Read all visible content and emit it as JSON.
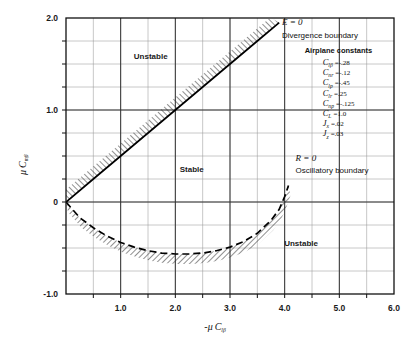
{
  "chart_data": {
    "type": "line",
    "title": "",
    "xlabel": "-μ Clβ",
    "ylabel": "μ Cmβ",
    "xlim": [
      0,
      6.0
    ],
    "ylim": [
      -1.0,
      2.0
    ],
    "xticks": [
      "1.0",
      "2.0",
      "3.0",
      "4.0",
      "5.0",
      "6.0"
    ],
    "xtick_values": [
      1.0,
      2.0,
      3.0,
      4.0,
      5.0,
      6.0
    ],
    "yticks": [
      "2.0",
      "1.0",
      "0",
      "-1.0"
    ],
    "ytick_values": [
      2.0,
      1.0,
      0,
      -1.0
    ],
    "grid": true,
    "grid_minor": true,
    "legend_position": "upper-right-inside",
    "series": [
      {
        "name": "Divergence boundary",
        "equation_label": "E = 0",
        "style": "solid-hatched",
        "hatch_side": "upper-left",
        "points": [
          [
            0,
            0
          ],
          [
            0.5,
            0.25
          ],
          [
            1.0,
            0.5
          ],
          [
            1.5,
            0.75
          ],
          [
            2.0,
            1.0
          ],
          [
            2.5,
            1.25
          ],
          [
            3.0,
            1.5
          ],
          [
            3.5,
            1.75
          ],
          [
            3.9,
            1.95
          ]
        ]
      },
      {
        "name": "Oscillatory boundary",
        "equation_label": "R = 0",
        "style": "dashed-hatched",
        "hatch_side": "below",
        "points": [
          [
            0,
            0
          ],
          [
            0.25,
            -0.17
          ],
          [
            0.5,
            -0.28
          ],
          [
            0.75,
            -0.37
          ],
          [
            1.0,
            -0.44
          ],
          [
            1.25,
            -0.49
          ],
          [
            1.5,
            -0.53
          ],
          [
            1.75,
            -0.555
          ],
          [
            2.0,
            -0.565
          ],
          [
            2.25,
            -0.565
          ],
          [
            2.5,
            -0.555
          ],
          [
            2.75,
            -0.53
          ],
          [
            3.0,
            -0.49
          ],
          [
            3.25,
            -0.43
          ],
          [
            3.5,
            -0.34
          ],
          [
            3.75,
            -0.2
          ],
          [
            3.9,
            -0.08
          ],
          [
            4.0,
            0.06
          ],
          [
            4.07,
            0.18
          ]
        ]
      }
    ],
    "region_labels": [
      {
        "text": "Unstable",
        "x": 1.55,
        "y": 1.55
      },
      {
        "text": "Stable",
        "x": 2.3,
        "y": 0.33
      },
      {
        "text": "Unstable",
        "x": 4.3,
        "y": -0.48
      }
    ],
    "annotations": [
      {
        "text": "E = 0",
        "x": 3.95,
        "y": 1.92
      },
      {
        "text": "Divergence boundary",
        "x": 3.95,
        "y": 1.78
      },
      {
        "text": "R = 0",
        "x": 4.2,
        "y": 0.45
      },
      {
        "text": "Oscillatory boundary",
        "x": 4.2,
        "y": 0.32
      }
    ],
    "constants_box": {
      "title": "Airplane constants",
      "items": [
        {
          "symbol": "C",
          "sub": "lβ",
          "value": "=-.28"
        },
        {
          "symbol": "C",
          "sub": "nr",
          "value": "=-.12"
        },
        {
          "symbol": "C",
          "sub": "lp",
          "value": "=-.45"
        },
        {
          "symbol": "C",
          "sub": "lr",
          "value": "=.25"
        },
        {
          "symbol": "C",
          "sub": "np",
          "value": "=-.125"
        },
        {
          "symbol": "C",
          "sub": "L",
          "value": "=1.0"
        },
        {
          "symbol": "J",
          "sub": "x",
          "value": "=.02"
        },
        {
          "symbol": "J",
          "sub": "z",
          "value": "=.03"
        }
      ]
    }
  },
  "axis": {
    "y_title_mu": "μ",
    "y_title_c": "C",
    "y_title_sub": "mβ",
    "x_title_minus_mu": "-μ",
    "x_title_c": "C",
    "x_title_sub": "lβ"
  }
}
